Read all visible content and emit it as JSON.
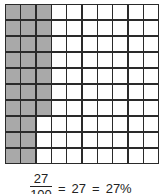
{
  "grid": {
    "rows": 10,
    "cols": 10,
    "shaded_count": 27,
    "shaded_color": "#a9a9a9",
    "line_color": "#2a2a2a",
    "shading_rule": "column-major from left, top to bottom"
  },
  "equation": {
    "numerator": "27",
    "denominator": "100",
    "equals1": "=",
    "middle": "27",
    "equals2": "=",
    "percent": "27%"
  }
}
